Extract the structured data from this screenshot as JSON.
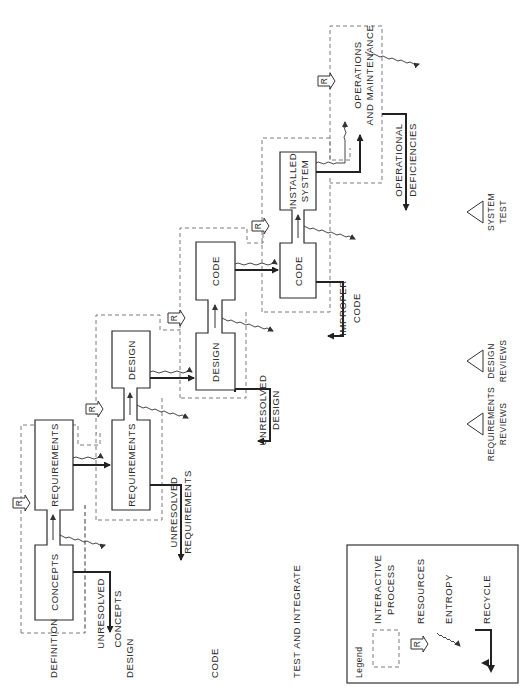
{
  "diagram": {
    "orientation": "rotated 90 degrees counter-clockwise",
    "phase_labels": [
      "DEFINITION",
      "DESIGN",
      "CODE",
      "TEST AND INTEGRATE"
    ],
    "processes": [
      {
        "id": "p1",
        "upper": "REQUIREMENTS",
        "lower": "CONCEPTS"
      },
      {
        "id": "p2",
        "upper": "DESIGN",
        "lower": "REQUIREMENTS"
      },
      {
        "id": "p3",
        "upper": "CODE",
        "lower": "DESIGN"
      },
      {
        "id": "p4",
        "upper_line1": "INSTALLED",
        "upper_line2": "SYSTEM",
        "lower": "CODE"
      }
    ],
    "final_process": {
      "line1": "OPERATIONS",
      "line2": "AND MAINTENANCE"
    },
    "recycle_outputs": [
      {
        "line1": "UNRESOLVED",
        "line2": "CONCEPTS"
      },
      {
        "line1": "UNRESOLVED",
        "line2": "REQUIREMENTS"
      },
      {
        "line1": "UNRESOLVED",
        "line2": "DESIGN"
      },
      {
        "line1": "IMPROPER",
        "line2": "CODE"
      },
      {
        "line1": "OPERATIONAL",
        "line2": "DEFICIENCIES"
      }
    ],
    "resource_marker": "R",
    "milestones": [
      {
        "line1": "REQUIREMENTS",
        "line2": "REVIEWS"
      },
      {
        "line1": "DESIGN",
        "line2": "REVIEWS"
      },
      {
        "line1": "SYSTEM",
        "line2": "TEST"
      }
    ]
  },
  "legend": {
    "title": "Legend",
    "items": [
      {
        "symbol": "dashed-box",
        "line1": "INTERACTIVE",
        "line2": "PROCESS"
      },
      {
        "symbol": "resource-arrow",
        "line1": "RESOURCES"
      },
      {
        "symbol": "wavy-arrow",
        "line1": "ENTROPY"
      },
      {
        "symbol": "recycle-arrow",
        "line1": "RECYCLE"
      }
    ]
  }
}
